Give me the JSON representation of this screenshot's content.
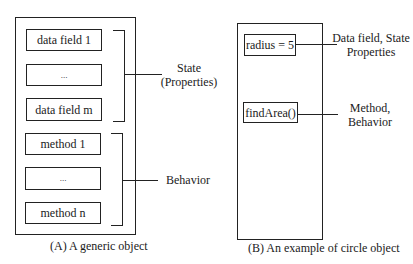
{
  "diagram_a": {
    "fields": [
      {
        "label": "data field 1"
      },
      {
        "label": "..."
      },
      {
        "label": "data field m"
      }
    ],
    "methods": [
      {
        "label": "method 1"
      },
      {
        "label": "..."
      },
      {
        "label": "method n"
      }
    ],
    "state_label_line1": "State",
    "state_label_line2": "(Properties)",
    "behavior_label": "Behavior",
    "caption": "(A)  A generic object"
  },
  "diagram_b": {
    "field": {
      "label": "radius = 5"
    },
    "method": {
      "label": "findArea()"
    },
    "field_annotation_line1": "Data field, State",
    "field_annotation_line2": "Properties",
    "method_annotation_line1": "Method,",
    "method_annotation_line2": "Behavior",
    "caption": "(B)  An example of circle object"
  }
}
